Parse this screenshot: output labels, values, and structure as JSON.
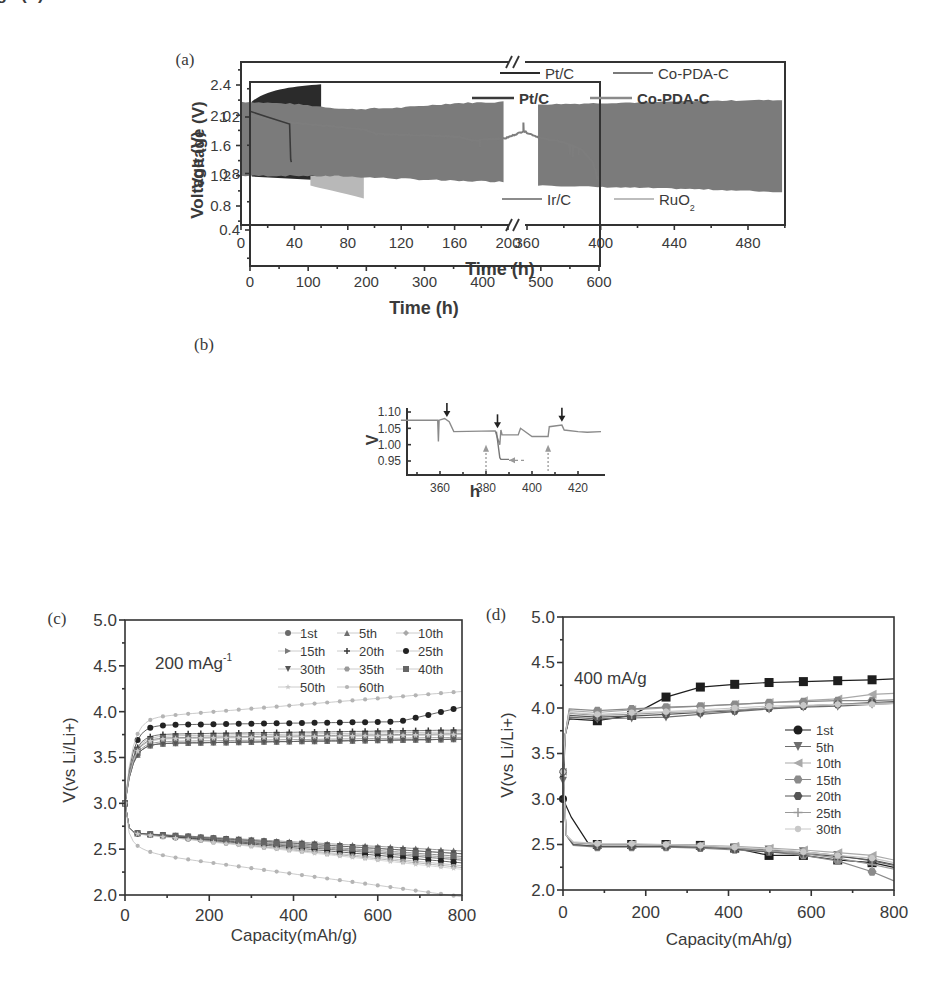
{
  "figure": {
    "panels": [
      "(a)",
      "(b)",
      "(c)",
      "(d)"
    ]
  },
  "chart_data": [
    {
      "panel": "(a)",
      "type": "area",
      "title": "",
      "xlabel": "Time (h)",
      "ylabel": "Voltage (V)",
      "ylim": [
        0.55,
        2.65
      ],
      "yticks": [
        "0.8",
        "1.2",
        "1.6",
        "2.0",
        "2.4"
      ],
      "xaxis_break": {
        "from": 200,
        "to": 360
      },
      "xticks_left": [
        "0",
        "40",
        "80",
        "120",
        "160",
        "200"
      ],
      "xticks_right": [
        "360",
        "400",
        "440",
        "480"
      ],
      "xlim": [
        0,
        500
      ],
      "grid": false,
      "legend": [
        {
          "label": "Pt/C",
          "color": "#2a2a2a",
          "position": "top"
        },
        {
          "label": "Co-PDA-C",
          "color": "#7a7a7a",
          "position": "top"
        },
        {
          "label": "Ir/C",
          "color": "#8c8c8c",
          "position": "bottom"
        },
        {
          "label": "RuO",
          "sub": "2",
          "color": "#bdbdbd",
          "position": "bottom"
        }
      ],
      "series": [
        {
          "name": "Pt/C",
          "t_end": 60,
          "charge_V": [
            2.2,
            2.3,
            2.37,
            2.4
          ],
          "discharge_V": [
            1.2,
            1.18,
            1.16,
            1.14
          ],
          "t": [
            10,
            25,
            45,
            60
          ]
        },
        {
          "name": "RuO2",
          "t_end": 92,
          "charge_V": [
            2.1,
            2.1
          ],
          "discharge_V": [
            1.05,
            0.9
          ],
          "t": [
            52,
            92
          ]
        },
        {
          "name": "Ir/C",
          "t_end": 60,
          "charge_V": [
            2.15
          ],
          "discharge_V": [
            1.17
          ],
          "t": [
            60
          ]
        },
        {
          "name": "Co-PDA-C",
          "t": [
            0,
            40,
            80,
            120,
            160,
            200,
            360,
            400,
            440,
            480,
            500
          ],
          "charge_V": [
            2.18,
            2.15,
            2.08,
            2.1,
            2.16,
            2.18,
            2.14,
            2.16,
            2.18,
            2.2,
            2.2
          ],
          "discharge_V": [
            1.2,
            1.2,
            1.19,
            1.16,
            1.13,
            1.12,
            1.08,
            1.05,
            1.03,
            1.0,
            0.98
          ]
        }
      ]
    },
    {
      "panel": "(b)",
      "type": "line",
      "xlabel": "Time (h)",
      "ylabel": "Voltage (V)",
      "xlim": [
        0,
        600
      ],
      "ylim": [
        0.15,
        1.45
      ],
      "xticks": [
        "0",
        "100",
        "200",
        "300",
        "400",
        "500",
        "600"
      ],
      "yticks": [
        "0.4",
        "0.8",
        "1.2"
      ],
      "grid": false,
      "legend": [
        {
          "label": "Pt/C",
          "color": "#3a3a3a"
        },
        {
          "label": "Co-PDA-C",
          "color": "#8a8a8a"
        }
      ],
      "series": [
        {
          "name": "Pt/C",
          "x": [
            0,
            30,
            68,
            70,
            71
          ],
          "y": [
            1.24,
            1.2,
            1.15,
            0.9,
            0.88
          ]
        },
        {
          "name": "Co-PDA-C",
          "x": [
            0,
            70,
            150,
            200,
            215,
            300,
            360,
            385,
            400,
            440,
            470,
            500,
            540,
            570,
            590,
            600
          ],
          "y": [
            1.21,
            1.16,
            1.13,
            1.11,
            1.08,
            1.07,
            1.06,
            1.03,
            1.04,
            1.05,
            1.1,
            1.05,
            1.02,
            0.97,
            0.88,
            0.75
          ]
        }
      ],
      "inset": {
        "xlabel": "h",
        "ylabel": "V",
        "xlim": [
          343,
          430
        ],
        "ylim": [
          0.93,
          1.12
        ],
        "xticks": [
          "360",
          "380",
          "400",
          "420"
        ],
        "yticks": [
          "0.95",
          "1.00",
          "1.05",
          "1.10"
        ],
        "series": [
          {
            "name": "Co-PDA-C",
            "x": [
              343,
              359,
              359.3,
              359.6,
              362,
              364,
              366,
              384,
              385,
              386,
              386.5,
              387,
              394,
              395,
              400,
              407,
              407.5,
              413,
              414,
              420,
              424,
              430
            ],
            "y": [
              1.075,
              1.075,
              1.01,
              1.075,
              1.08,
              1.07,
              1.04,
              1.042,
              1.02,
              1.0,
              1.045,
              1.03,
              1.03,
              1.05,
              1.025,
              1.025,
              1.055,
              1.06,
              1.045,
              1.04,
              1.038,
              1.04
            ]
          },
          {
            "name": "Pt/C",
            "x": [
              384.5,
              386,
              386.5,
              390
            ],
            "y": [
              1.04,
              0.96,
              0.955,
              0.955
            ]
          }
        ],
        "annotations": [
          {
            "type": "arrow-down-solid",
            "x": 363,
            "y": 1.085
          },
          {
            "type": "arrow-down-solid",
            "x": 385,
            "y": 1.05
          },
          {
            "type": "arrow-down-solid",
            "x": 413,
            "y": 1.07
          },
          {
            "type": "arrow-up-dashed",
            "x": 380,
            "y": 1.02
          },
          {
            "type": "arrow-up-dashed",
            "x": 407,
            "y": 1.02
          },
          {
            "type": "arrow-left-dashed",
            "x": 390,
            "y": 0.955
          }
        ]
      }
    },
    {
      "panel": "(c)",
      "type": "scatter",
      "annotation": "200 mAg",
      "annotation_sup": "-1",
      "xlabel": "Capacity(mAh/g)",
      "ylabel": "V(vs Li/Li+)",
      "xlim": [
        0,
        800
      ],
      "ylim": [
        2.0,
        5.0
      ],
      "xticks": [
        "0",
        "200",
        "400",
        "600",
        "800"
      ],
      "yticks": [
        "2.0",
        "2.5",
        "3.0",
        "3.5",
        "4.0",
        "4.5",
        "5.0"
      ],
      "grid": false,
      "legend_position": "upper right",
      "series": [
        {
          "name": "1st",
          "marker": "circle",
          "charge_end": 3.7,
          "discharge_end": 2.45
        },
        {
          "name": "5th",
          "marker": "triangle-up",
          "charge_end": 3.7,
          "discharge_end": 2.48
        },
        {
          "name": "10th",
          "marker": "diamond",
          "charge_end": 3.78,
          "discharge_end": 2.32
        },
        {
          "name": "15th",
          "marker": "triangle-right",
          "charge_end": 3.72,
          "discharge_end": 2.4
        },
        {
          "name": "20th",
          "marker": "plus",
          "charge_end": 3.8,
          "discharge_end": 2.38
        },
        {
          "name": "25th",
          "marker": "club",
          "charge_end": 3.9,
          "discharge_end": 2.35
        },
        {
          "name": "30th",
          "marker": "triangle-down",
          "charge_end": 3.7,
          "discharge_end": 2.45
        },
        {
          "name": "35th",
          "marker": "hexagon",
          "charge_end": 3.75,
          "discharge_end": 2.3
        },
        {
          "name": "40th",
          "marker": "square",
          "charge_end": 3.76,
          "discharge_end": 2.42
        },
        {
          "name": "50th",
          "marker": "star",
          "charge_end": 3.75,
          "discharge_end": 2.28
        },
        {
          "name": "60th",
          "marker": "dot",
          "charge_end": 3.97,
          "discharge_end": 2.18
        }
      ],
      "x": [
        0,
        25,
        50,
        100,
        200,
        300,
        400,
        500,
        600,
        700,
        800
      ]
    },
    {
      "panel": "(d)",
      "type": "line",
      "annotation": "400 mA/g",
      "xlabel": "Capacity(mAh/g)",
      "ylabel": "V(vs Li/Li+)",
      "xlim": [
        0,
        800
      ],
      "ylim": [
        2.0,
        5.0
      ],
      "xticks": [
        "0",
        "200",
        "400",
        "600",
        "800"
      ],
      "yticks": [
        "2.0",
        "2.5",
        "3.0",
        "3.5",
        "4.0",
        "4.5",
        "5.0"
      ],
      "grid": false,
      "legend_position": "center right",
      "x_markers": [
        0,
        83,
        166,
        249,
        332,
        415,
        498,
        581,
        664,
        747
      ],
      "series": [
        {
          "name": "1st",
          "marker": "square",
          "charge": [
            3.0,
            3.86,
            3.92,
            4.12,
            4.23,
            4.26,
            4.28,
            4.29,
            4.3,
            4.31
          ],
          "discharge": [
            3.0,
            2.5,
            2.5,
            2.5,
            2.49,
            2.46,
            2.38,
            2.38,
            2.33,
            2.3
          ]
        },
        {
          "name": "5th",
          "marker": "triangle-down",
          "charge": [
            3.2,
            3.88,
            3.89,
            3.9,
            3.93,
            3.96,
            3.99,
            4.01,
            4.02,
            4.04
          ],
          "discharge": [
            3.2,
            2.48,
            2.48,
            2.48,
            2.47,
            2.46,
            2.44,
            2.42,
            2.38,
            2.32
          ]
        },
        {
          "name": "10th",
          "marker": "triangle-left",
          "charge": [
            3.3,
            3.95,
            3.98,
            4.0,
            4.02,
            4.04,
            4.06,
            4.08,
            4.1,
            4.15
          ],
          "discharge": [
            3.3,
            2.5,
            2.5,
            2.5,
            2.49,
            2.48,
            2.46,
            2.44,
            2.41,
            2.38
          ]
        },
        {
          "name": "15th",
          "marker": "hexagon",
          "charge": [
            3.3,
            3.97,
            3.99,
            4.01,
            4.02,
            4.04,
            4.06,
            4.07,
            4.08,
            4.08
          ],
          "discharge": [
            3.3,
            2.47,
            2.47,
            2.47,
            2.46,
            2.44,
            2.42,
            2.38,
            2.32,
            2.2
          ]
        },
        {
          "name": "20th",
          "marker": "hexagon-dark",
          "charge": [
            3.3,
            3.9,
            3.91,
            3.93,
            3.95,
            3.97,
            4.0,
            4.02,
            4.04,
            4.06
          ],
          "discharge": [
            3.3,
            2.48,
            2.48,
            2.48,
            2.47,
            2.45,
            2.42,
            2.4,
            2.37,
            2.33
          ]
        },
        {
          "name": "25th",
          "marker": "plus",
          "charge": [
            3.3,
            3.92,
            3.93,
            3.95,
            3.96,
            3.98,
            4.0,
            4.02,
            4.04,
            4.05
          ],
          "discharge": [
            3.3,
            2.5,
            2.5,
            2.49,
            2.48,
            2.46,
            2.43,
            2.4,
            2.35,
            2.28
          ]
        },
        {
          "name": "30th",
          "marker": "dot",
          "charge": [
            3.3,
            3.93,
            3.95,
            3.96,
            3.98,
            4.0,
            4.02,
            4.03,
            4.04,
            4.04
          ],
          "discharge": [
            3.3,
            2.51,
            2.51,
            2.5,
            2.49,
            2.47,
            2.45,
            2.42,
            2.38,
            2.35
          ]
        }
      ]
    }
  ]
}
